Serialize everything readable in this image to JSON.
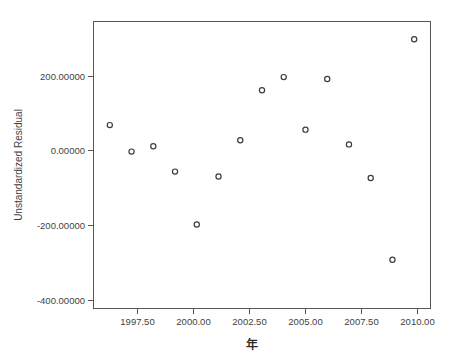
{
  "chart_data": {
    "type": "scatter",
    "title": "",
    "xlabel": "年",
    "ylabel": "Unstandardized Residual",
    "x": [
      1996,
      1997,
      1998,
      1999,
      2000,
      2001,
      2002,
      2003,
      2004,
      2005,
      2006,
      2007,
      2008,
      2009,
      2010
    ],
    "values": [
      48,
      -22,
      -8,
      -75,
      -215,
      -88,
      8,
      140,
      175,
      36,
      170,
      -3,
      -92,
      -308,
      275
    ],
    "series": [
      {
        "name": "Unstandardized Residual",
        "points": [
          {
            "x": 1996,
            "y": 48
          },
          {
            "x": 1997,
            "y": -22
          },
          {
            "x": 1998,
            "y": -8
          },
          {
            "x": 1999,
            "y": -75
          },
          {
            "x": 2000,
            "y": -215
          },
          {
            "x": 2001,
            "y": -88
          },
          {
            "x": 2002,
            "y": 8
          },
          {
            "x": 2003,
            "y": 140
          },
          {
            "x": 2004,
            "y": 175
          },
          {
            "x": 2005,
            "y": 36
          },
          {
            "x": 2006,
            "y": 170
          },
          {
            "x": 2007,
            "y": -3
          },
          {
            "x": 2008,
            "y": -92
          },
          {
            "x": 2009,
            "y": -308
          },
          {
            "x": 2010,
            "y": 275
          }
        ]
      }
    ],
    "xlim": [
      1995.25,
      2010.75
    ],
    "ylim": [
      -437,
      322
    ],
    "xticks": [
      1997.5,
      2000.0,
      2002.5,
      2005.0,
      2007.5,
      2010.0
    ],
    "xtick_labels": [
      "1997.50",
      "2000.00",
      "2002.50",
      "2005.00",
      "2007.50",
      "2010.00"
    ],
    "yticks": [
      200,
      0,
      -200,
      -400
    ],
    "ytick_labels": [
      "200.00000",
      "0.00000",
      "-200.00000",
      "-400.00000"
    ],
    "grid": false,
    "legend": null,
    "marker_style": "open-circle",
    "marker_color": "#3c3c3c",
    "frame_color": "#555555",
    "background": "#ffffff"
  },
  "axes": {
    "y_title": "Unstandardized Residual",
    "x_title": "年"
  },
  "ytick_labels": {
    "0": "200.00000",
    "1": "0.00000",
    "2": "-200.00000",
    "3": "-400.00000"
  },
  "xtick_labels": {
    "0": "1997.50",
    "1": "2000.00",
    "2": "2002.50",
    "3": "2005.00",
    "4": "2007.50",
    "5": "2010.00"
  }
}
